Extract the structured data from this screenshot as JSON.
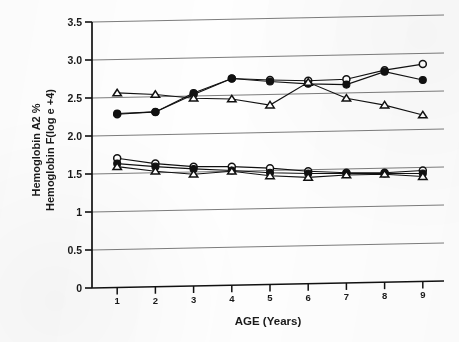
{
  "chart_data": {
    "type": "line",
    "title": "",
    "xlabel": "AGE (Years)",
    "ylabel_line1": "Hemoglobin A2 %",
    "ylabel_line2": "Hemoglobin F(log e +4)",
    "x": [
      1,
      2,
      3,
      4,
      5,
      6,
      7,
      8,
      9
    ],
    "xtick_labels": [
      "1",
      "2",
      "3",
      "4",
      "5",
      "6",
      "7",
      "8",
      "9"
    ],
    "ytick_labels": [
      "0",
      "0.5",
      "1",
      "1.5",
      "2.0",
      "2.5",
      "3.0",
      "3.5"
    ],
    "ytick_values": [
      0,
      0.5,
      1,
      1.5,
      2.0,
      2.5,
      3.0,
      3.5
    ],
    "xlim": [
      0.55,
      9.45
    ],
    "ylim": [
      0,
      3.5
    ],
    "grid": "horizontal",
    "legend": "none",
    "series": [
      {
        "name": "Hemoglobin A2 % - open circle",
        "marker": "open-circle",
        "group": "upper",
        "values": [
          2.28,
          2.3,
          2.52,
          2.72,
          2.69,
          2.67,
          2.68,
          2.79,
          2.86
        ]
      },
      {
        "name": "Hemoglobin A2 % - filled circle",
        "marker": "filled-circle",
        "group": "upper",
        "values": [
          2.29,
          2.3,
          2.54,
          2.72,
          2.67,
          2.63,
          2.61,
          2.77,
          2.65
        ]
      },
      {
        "name": "Hemoglobin A2 % - open triangle",
        "marker": "open-triangle",
        "group": "upper",
        "values": [
          2.56,
          2.53,
          2.47,
          2.45,
          2.36,
          2.65,
          2.43,
          2.33,
          2.19
        ]
      },
      {
        "name": "Hemoglobin F(log e +4) - open circle",
        "marker": "open-circle",
        "group": "lower",
        "values": [
          1.7,
          1.62,
          1.57,
          1.56,
          1.53,
          1.48,
          1.45,
          1.44,
          1.46
        ]
      },
      {
        "name": "Hemoglobin F(log e +4) - filled circle",
        "marker": "filled-circle",
        "group": "lower",
        "values": [
          1.63,
          1.58,
          1.54,
          1.51,
          1.47,
          1.45,
          1.44,
          1.43,
          1.42
        ]
      },
      {
        "name": "Hemoglobin F(log e +4) - open triangle",
        "marker": "open-triangle",
        "group": "lower",
        "values": [
          1.59,
          1.52,
          1.47,
          1.5,
          1.43,
          1.4,
          1.42,
          1.42,
          1.38
        ]
      }
    ],
    "colors": {
      "line": "#111111",
      "grid": "#4a4a4a",
      "axis": "#111111",
      "marker_fill_open": "#ffffff",
      "marker_fill_solid": "#111111",
      "background": "#ffffff"
    }
  }
}
